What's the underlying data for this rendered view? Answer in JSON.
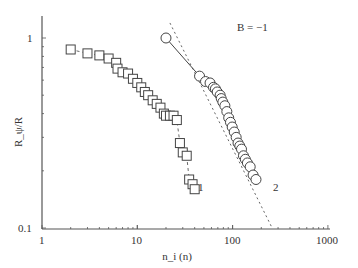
{
  "chart_data": {
    "type": "scatter",
    "title": "",
    "xlabel": "n_i (n)",
    "ylabel": "R_ψ/R",
    "xscale": "log",
    "yscale": "log",
    "xlim": [
      1,
      1000
    ],
    "ylim": [
      0.1,
      1.25
    ],
    "x_ticks": [
      "1",
      "10",
      "100",
      "1000"
    ],
    "y_ticks": [
      "0.1",
      "1"
    ],
    "grid": false,
    "legend": "none (series labeled inline)",
    "annotations": [
      {
        "text": "B = −1",
        "near": "dashed reference line",
        "x": 115,
        "y": 1.0
      },
      {
        "text": "1",
        "near": "end of series 1"
      },
      {
        "text": "2",
        "near": "end of series 2"
      }
    ],
    "series": [
      {
        "name": "1",
        "marker": "open-square",
        "line": "dashed connecting",
        "x": [
          2,
          3,
          4,
          5,
          6,
          6.2,
          7,
          8,
          9,
          10,
          11,
          12,
          13,
          14.5,
          16,
          17.5,
          19,
          20,
          22,
          24,
          26,
          28,
          30,
          33,
          35,
          38,
          40
        ],
        "y": [
          0.87,
          0.83,
          0.81,
          0.78,
          0.74,
          0.69,
          0.66,
          0.65,
          0.61,
          0.58,
          0.55,
          0.52,
          0.5,
          0.47,
          0.45,
          0.43,
          0.4,
          0.39,
          0.39,
          0.39,
          0.37,
          0.28,
          0.25,
          0.24,
          0.18,
          0.17,
          0.16
        ]
      },
      {
        "name": "2",
        "marker": "open-circle",
        "line": "solid connecting",
        "x": [
          20,
          45,
          52,
          58,
          63,
          66,
          69,
          74,
          76,
          79,
          83,
          87,
          91,
          95,
          99,
          104,
          109,
          114,
          119,
          124,
          130,
          136,
          143,
          153,
          164,
          176
        ],
        "y": [
          1.0,
          0.63,
          0.59,
          0.58,
          0.55,
          0.54,
          0.52,
          0.5,
          0.48,
          0.46,
          0.44,
          0.41,
          0.38,
          0.36,
          0.34,
          0.32,
          0.3,
          0.28,
          0.27,
          0.26,
          0.24,
          0.23,
          0.22,
          0.21,
          0.19,
          0.18
        ]
      },
      {
        "name": "B = −1 reference",
        "style": "dotted line",
        "x": [
          22,
          260
        ],
        "y": [
          1.2,
          0.1
        ]
      }
    ]
  },
  "labels": {
    "y_axis": "R_ψ/R",
    "x_axis": "n_i (n)",
    "slope_annotation": "B = −1",
    "series_1_label": "1",
    "series_2_label": "2",
    "y_tick_top": "1",
    "y_tick_bottom": "0.1",
    "x_tick_1": "1",
    "x_tick_10": "10",
    "x_tick_100": "100",
    "x_tick_1000": "1000"
  },
  "colors": {
    "axis": "#555555",
    "marker": "#444444",
    "background": "#ffffff"
  }
}
